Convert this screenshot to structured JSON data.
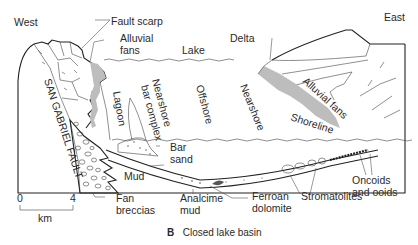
{
  "diagram": {
    "caption_letter": "B",
    "caption_text": "Closed lake basin",
    "directions": {
      "west": "West",
      "east": "East"
    },
    "water_label": "Lake",
    "labels": {
      "fault_scarp": "Fault scarp",
      "alluvial_fans_west_1": "Alluvial",
      "alluvial_fans_west_2": "fans",
      "delta": "Delta",
      "san_gabriel_fault": "SAN GABRIEL FAULT",
      "lagoon": "Lagoon",
      "nearshore_bar_complex_1": "Nearshore",
      "nearshore_bar_complex_2": "bar complex",
      "offshore": "Offshore",
      "nearshore": "Nearshore",
      "alluvial_fans_east": "Alluvial fans",
      "shoreline": "Shoreline",
      "bar_sand_1": "Bar",
      "bar_sand_2": "sand",
      "mud": "Mud",
      "fan_breccias_1": "Fan",
      "fan_breccias_2": "breccias",
      "analcime_mud_1": "Analcime",
      "analcime_mud_2": "mud",
      "ferroan_dolomite_1": "Ferroan",
      "ferroan_dolomite_2": "dolomite",
      "stromatolites": "Stromatolites",
      "oncoids_1": "Oncoids",
      "oncoids_2": "and ooids"
    },
    "scale_bar": {
      "start": "0",
      "end": "4",
      "unit": "km"
    },
    "colors": {
      "line": "#222222",
      "shading": "#bdbdbd",
      "background": "#ffffff"
    }
  }
}
